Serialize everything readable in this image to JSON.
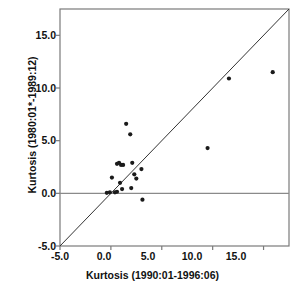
{
  "chart_data": {
    "type": "scatter",
    "title": "",
    "xlabel": "Kurtosis  (1990:01-1996:06)",
    "ylabel": "Kurtosis (1980:01*-1989:12)",
    "xlim": [
      -5.0,
      17.5
    ],
    "ylim": [
      -5.0,
      17.5
    ],
    "xticks": [
      "-5.0",
      "0.0",
      "5.0",
      "10.0",
      "15.0"
    ],
    "xtick_values": [
      -5.0,
      0.0,
      5.0,
      10.0,
      15.0
    ],
    "yticks": [
      "-5.0",
      "0.0",
      "5.0",
      "10.0",
      "15.0"
    ],
    "ytick_values": [
      -5.0,
      0.0,
      5.0,
      10.0,
      15.0
    ],
    "grid": false,
    "legend": "none",
    "reference_lines": [
      {
        "name": "identity-line",
        "type": "diagonal",
        "slope": 1,
        "intercept": 0,
        "color": "#333333"
      },
      {
        "name": "zero-line",
        "type": "horizontal",
        "y": 0.0,
        "color": "#888888"
      }
    ],
    "marker": {
      "shape": "circle",
      "color": "#1a1a1a",
      "size": 4.2
    },
    "points": [
      {
        "x": -0.4,
        "y": 0.05
      },
      {
        "x": -0.1,
        "y": 0.1
      },
      {
        "x": 0.1,
        "y": 1.5
      },
      {
        "x": 0.4,
        "y": 0.1
      },
      {
        "x": 0.6,
        "y": 0.15
      },
      {
        "x": 0.6,
        "y": 2.8
      },
      {
        "x": 0.8,
        "y": 2.9
      },
      {
        "x": 0.9,
        "y": 1.0
      },
      {
        "x": 1.0,
        "y": 2.7
      },
      {
        "x": 1.1,
        "y": 0.4
      },
      {
        "x": 1.2,
        "y": 2.7
      },
      {
        "x": 1.5,
        "y": 6.6
      },
      {
        "x": 1.9,
        "y": 5.6
      },
      {
        "x": 2.0,
        "y": 0.5
      },
      {
        "x": 2.1,
        "y": 2.9
      },
      {
        "x": 2.3,
        "y": 1.8
      },
      {
        "x": 2.5,
        "y": 1.4
      },
      {
        "x": 3.0,
        "y": 2.3
      },
      {
        "x": 3.1,
        "y": -0.6
      },
      {
        "x": 9.5,
        "y": 4.3
      },
      {
        "x": 11.6,
        "y": 10.9
      },
      {
        "x": 15.9,
        "y": 11.5
      }
    ]
  },
  "colors": {
    "frame": "#7a7a7a",
    "marker": "#1a1a1a",
    "identity_line": "#333333",
    "zero_line": "#8a8a8a",
    "text": "#111111",
    "background": "#ffffff"
  }
}
